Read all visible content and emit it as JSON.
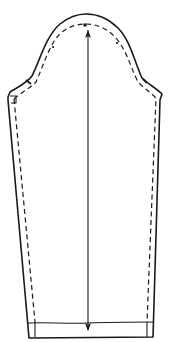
{
  "diagram": {
    "elements": {
      "cutting_line": "solid outer outline",
      "seam_line": "dashed inner line (seam allowance)",
      "grainline": "double-headed vertical arrow",
      "hem_fold_line": "horizontal line near bottom",
      "notches": [
        "front notch on left cap",
        "back notch on right cap",
        "shoulder point dot at cap top"
      ]
    },
    "colors": {
      "ink": "#1a1a1a",
      "paper": "#ffffff"
    }
  }
}
